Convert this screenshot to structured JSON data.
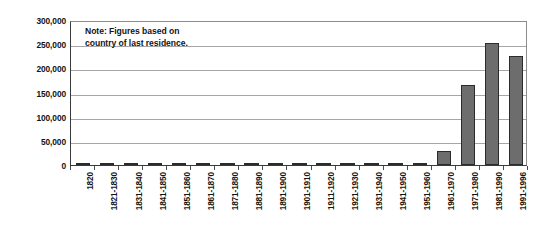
{
  "chart_data": {
    "type": "bar",
    "title": "",
    "subtitle": "",
    "xlabel": "",
    "ylabel": "",
    "annotation": "Note: Figures based on\ncountry of last residence.",
    "ylim": [
      0,
      300000
    ],
    "ytick_labels": [
      "300,000",
      "250,000",
      "200,000",
      "150,000",
      "100,000",
      "50,000",
      "0"
    ],
    "ytick_values": [
      300000,
      250000,
      200000,
      150000,
      100000,
      50000,
      0
    ],
    "grid": true,
    "legend": "none",
    "bar_color": "#6d6d6d",
    "bar_border_color": "#2b2b2b",
    "categories": [
      "1820",
      "1821-1830",
      "1831-1840",
      "1841-1850",
      "1851-1860",
      "1861-1870",
      "1871-1880",
      "1881-1890",
      "1891-1900",
      "1901-1910",
      "1911-1920",
      "1921-1930",
      "1931-1940",
      "1941-1950",
      "1951-1960",
      "1961-1970",
      "1971-1980",
      "1981-1990",
      "1991-1996"
    ],
    "values": [
      0,
      0,
      0,
      0,
      0,
      0,
      200,
      500,
      1000,
      4000,
      1500,
      1200,
      500,
      800,
      1500,
      29000,
      166000,
      252000,
      225000
    ]
  }
}
